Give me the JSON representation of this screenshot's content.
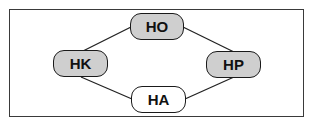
{
  "diagram": {
    "nodes": [
      {
        "id": "HO",
        "label": "HO",
        "fill": "#cfcfcf"
      },
      {
        "id": "HK",
        "label": "HK",
        "fill": "#cfcfcf"
      },
      {
        "id": "HP",
        "label": "HP",
        "fill": "#cfcfcf"
      },
      {
        "id": "HA",
        "label": "HA",
        "fill": "#ffffff"
      }
    ],
    "edges": [
      {
        "from": "HK",
        "to": "HO"
      },
      {
        "from": "HO",
        "to": "HP"
      },
      {
        "from": "HK",
        "to": "HA"
      },
      {
        "from": "HA",
        "to": "HP"
      }
    ]
  }
}
